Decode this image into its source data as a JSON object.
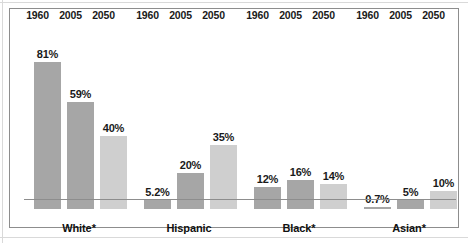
{
  "chart_data": {
    "type": "bar",
    "title": "",
    "subtitle": "",
    "xlabel": "",
    "ylabel": "",
    "ylim": [
      0,
      100
    ],
    "grid": false,
    "legend_position": "none",
    "categories": [
      "1960",
      "2005",
      "2050"
    ],
    "groups": [
      {
        "name": "White*",
        "bars": [
          {
            "year": "1960",
            "label": "81%",
            "value": 81,
            "shade": "mid"
          },
          {
            "year": "2005",
            "label": "59%",
            "value": 59,
            "shade": "mid"
          },
          {
            "year": "2050",
            "label": "40%",
            "value": 40,
            "shade": "light"
          }
        ]
      },
      {
        "name": "Hispanic",
        "bars": [
          {
            "year": "1960",
            "label": "5.2%",
            "value": 5.2,
            "shade": "mid"
          },
          {
            "year": "2005",
            "label": "20%",
            "value": 20,
            "shade": "mid"
          },
          {
            "year": "2050",
            "label": "35%",
            "value": 35,
            "shade": "light"
          }
        ]
      },
      {
        "name": "Black*",
        "bars": [
          {
            "year": "1960",
            "label": "12%",
            "value": 12,
            "shade": "mid"
          },
          {
            "year": "2005",
            "label": "16%",
            "value": 16,
            "shade": "mid"
          },
          {
            "year": "2050",
            "label": "14%",
            "value": 14,
            "shade": "light"
          }
        ]
      },
      {
        "name": "Asian*",
        "bars": [
          {
            "year": "1960",
            "label": "0.7%",
            "value": 0.7,
            "shade": "mid"
          },
          {
            "year": "2005",
            "label": "5%",
            "value": 5,
            "shade": "mid"
          },
          {
            "year": "2050",
            "label": "10%",
            "value": 10,
            "shade": "light"
          }
        ]
      }
    ],
    "colors": {
      "bar_mid": "#a6a6a6",
      "bar_light": "#cfcfcf",
      "axis": "#8d8d8d",
      "frame": "#8d8d8d",
      "text": "#1a1a1a",
      "background": "#ffffff"
    }
  }
}
